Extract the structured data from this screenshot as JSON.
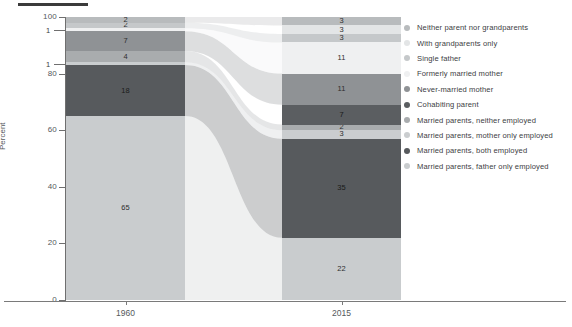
{
  "axis": {
    "ylabel": "Percent",
    "yticks": [
      0,
      20,
      40,
      60,
      80,
      100
    ],
    "ylim": [
      0,
      100
    ],
    "xticks": [
      "1960",
      "2015"
    ]
  },
  "annotations": {
    "leader_values": [
      "1",
      "1"
    ]
  },
  "legend": {
    "items": [
      {
        "label": "Neither parent nor grandparents",
        "color": "#b8bbbd"
      },
      {
        "label": "With grandparents only",
        "color": "#e3e5e6"
      },
      {
        "label": "Single father",
        "color": "#c5c8ca"
      },
      {
        "label": "Formerly married mother",
        "color": "#eff0f1"
      },
      {
        "label": "Never-married mother",
        "color": "#8f9295"
      },
      {
        "label": "Cohabiting parent",
        "color": "#5b5e61"
      },
      {
        "label": "Married parents, neither employed",
        "color": "#a9acae"
      },
      {
        "label": "Married parents, mother only employed",
        "color": "#cacdcf"
      },
      {
        "label": "Married parents, both employed",
        "color": "#575a5d"
      },
      {
        "label": "Married parents, father only employed",
        "color": "#c9ccce"
      }
    ]
  },
  "chart_data": {
    "type": "bar",
    "title": "",
    "subtitle": "",
    "xlabel": "",
    "ylabel": "Percent",
    "ylim": [
      0,
      100
    ],
    "grid": false,
    "stacked": true,
    "legend_position": "right",
    "categories": [
      "1960",
      "2015"
    ],
    "series": [
      {
        "name": "Married parents, father only employed",
        "color": "#c9ccce",
        "values": [
          65,
          22
        ]
      },
      {
        "name": "Married parents, both employed",
        "color": "#575a5d",
        "values": [
          18,
          35
        ]
      },
      {
        "name": "Married parents, mother only employed",
        "color": "#cacdcf",
        "values": [
          1,
          3
        ]
      },
      {
        "name": "Married parents, neither employed",
        "color": "#a9acae",
        "values": [
          4,
          2
        ]
      },
      {
        "name": "Cohabiting parent",
        "color": "#5b5e61",
        "values": [
          0,
          7
        ]
      },
      {
        "name": "Never-married mother",
        "color": "#8f9295",
        "values": [
          7,
          11
        ]
      },
      {
        "name": "Formerly married mother",
        "color": "#eff0f1",
        "values": [
          1,
          11
        ]
      },
      {
        "name": "Single father",
        "color": "#c5c8ca",
        "values": [
          2,
          3
        ]
      },
      {
        "name": "With grandparents only",
        "color": "#e3e5e6",
        "values": [
          0,
          3
        ]
      },
      {
        "name": "Neither parent nor grandparents",
        "color": "#b8bbbd",
        "values": [
          2,
          3
        ]
      }
    ],
    "bars": {
      "1960": {
        "segments": [
          {
            "label": "Married parents, father only employed",
            "value": 65,
            "shown": "65",
            "color": "#c9ccce"
          },
          {
            "label": "Married parents, both employed",
            "value": 18,
            "shown": "18",
            "color": "#575a5d"
          },
          {
            "label": "Married parents, mother only employed",
            "value": 1,
            "shown": "1",
            "color": "#cacdcf"
          },
          {
            "label": "Married parents, neither employed",
            "value": 4,
            "shown": "4",
            "color": "#a9acae"
          },
          {
            "label": "Never-married mother",
            "value": 7,
            "shown": "7",
            "color": "#8f9295"
          },
          {
            "label": "Formerly married mother",
            "value": 1,
            "shown": "1",
            "color": "#eff0f1"
          },
          {
            "label": "Single father",
            "value": 2,
            "shown": "2",
            "color": "#c5c8ca"
          },
          {
            "label": "Neither parent nor grandparents",
            "value": 2,
            "shown": "2",
            "color": "#b8bbbd"
          }
        ]
      },
      "2015": {
        "segments": [
          {
            "label": "Married parents, father only employed",
            "value": 22,
            "shown": "22",
            "color": "#c9ccce"
          },
          {
            "label": "Married parents, both employed",
            "value": 35,
            "shown": "35",
            "color": "#575a5d"
          },
          {
            "label": "Married parents, mother only employed",
            "value": 3,
            "shown": "3",
            "color": "#cacdcf"
          },
          {
            "label": "Married parents, neither employed",
            "value": 2,
            "shown": "2",
            "color": "#a9acae"
          },
          {
            "label": "Cohabiting parent",
            "value": 7,
            "shown": "7",
            "color": "#5b5e61"
          },
          {
            "label": "Never-married mother",
            "value": 11,
            "shown": "11",
            "color": "#8f9295"
          },
          {
            "label": "Formerly married mother",
            "value": 11,
            "shown": "11",
            "color": "#eff0f1"
          },
          {
            "label": "Single father",
            "value": 3,
            "shown": "3",
            "color": "#c5c8ca"
          },
          {
            "label": "With grandparents only",
            "value": 3,
            "shown": "3",
            "color": "#e3e5e6"
          },
          {
            "label": "Neither parent nor grandparents",
            "value": 3,
            "shown": "3",
            "color": "#b8bbbd"
          }
        ]
      }
    }
  }
}
